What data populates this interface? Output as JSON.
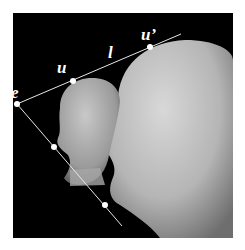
{
  "figure": {
    "labels": {
      "e": "e",
      "u": "u",
      "u_prime": "u’",
      "l": "l"
    },
    "colors": {
      "background": "#000000",
      "page": "#ffffff",
      "lines": "#e6e6e6",
      "points": "#ffffff"
    },
    "points": {
      "e": [
        17,
        104
      ],
      "u": [
        73,
        81
      ],
      "u_prime": [
        150,
        47
      ],
      "lower1": [
        54,
        147
      ],
      "lower2": [
        105,
        205
      ]
    }
  }
}
